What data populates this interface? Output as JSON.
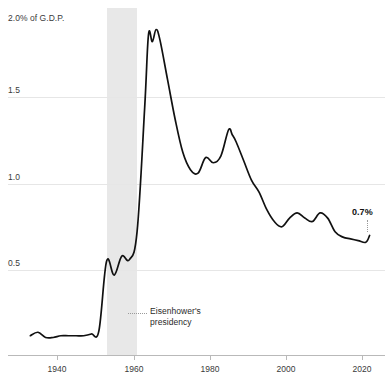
{
  "topstrip": {
    "cut_text": ""
  },
  "axes": {
    "y_caption": "2.0% of G.D.P.",
    "y_ticks": [
      {
        "value": 1.5,
        "label": "1.5",
        "y": 97
      },
      {
        "value": 1.0,
        "label": "1.0",
        "y": 184
      },
      {
        "value": 0.5,
        "label": "0.5",
        "y": 270
      }
    ],
    "x_ticks": [
      {
        "value": 1940,
        "label": "1940",
        "x": 57
      },
      {
        "value": 1960,
        "label": "1960",
        "x": 134
      },
      {
        "value": 1980,
        "label": "1980",
        "x": 210
      },
      {
        "value": 2000,
        "label": "2000",
        "x": 286
      },
      {
        "value": 2020,
        "label": "2020",
        "x": 362
      }
    ]
  },
  "annotations": {
    "era": {
      "label": "Eisenhower's\npresidency",
      "start_year": 1953,
      "end_year": 1961,
      "band_color": "#e8e8e8"
    },
    "end_value": {
      "label": "0.7%",
      "value": 0.7,
      "year": 2022
    }
  },
  "colors": {
    "line": "#111111",
    "grid": "#e6e6e6",
    "axis": "#b9b9b9",
    "band": "#e8e8e8",
    "text": "#3a3a3a"
  },
  "chart_data": {
    "type": "line",
    "title": "",
    "subtitle": "",
    "xlabel": "",
    "ylabel": "2.0% of G.D.P.",
    "xlim": [
      1933,
      2023
    ],
    "ylim": [
      0,
      2.0
    ],
    "grid": true,
    "legend": false,
    "series": [
      {
        "name": "Federal spending as share of G.D.P.",
        "x": [
          1933,
          1935,
          1937,
          1939,
          1941,
          1943,
          1945,
          1947,
          1949,
          1951,
          1953,
          1955,
          1957,
          1959,
          1961,
          1963,
          1964,
          1965,
          1966,
          1967,
          1969,
          1971,
          1973,
          1975,
          1977,
          1979,
          1981,
          1983,
          1985,
          1986,
          1987,
          1989,
          1991,
          1993,
          1995,
          1997,
          1999,
          2001,
          2003,
          2005,
          2007,
          2009,
          2011,
          2013,
          2015,
          2017,
          2019,
          2021,
          2022
        ],
        "values": [
          0.12,
          0.14,
          0.11,
          0.11,
          0.12,
          0.12,
          0.12,
          0.12,
          0.13,
          0.15,
          0.55,
          0.47,
          0.58,
          0.56,
          0.72,
          1.44,
          1.86,
          1.82,
          1.89,
          1.83,
          1.6,
          1.37,
          1.18,
          1.08,
          1.06,
          1.15,
          1.12,
          1.16,
          1.31,
          1.28,
          1.24,
          1.13,
          1.02,
          0.95,
          0.85,
          0.78,
          0.75,
          0.8,
          0.83,
          0.8,
          0.78,
          0.83,
          0.8,
          0.72,
          0.69,
          0.68,
          0.67,
          0.66,
          0.7
        ]
      }
    ]
  }
}
